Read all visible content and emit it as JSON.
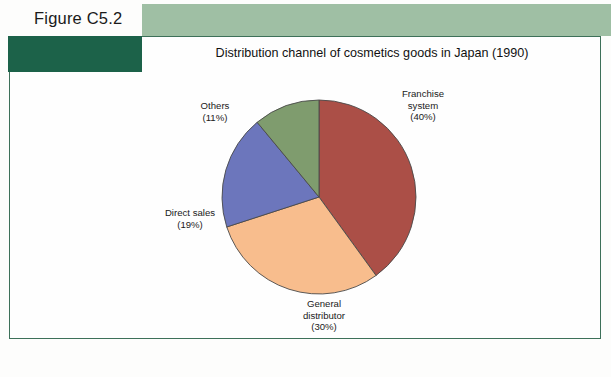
{
  "figure": {
    "number_label": "Figure C5.2",
    "title": "Distribution channel of cosmetics goods in Japan (1990)"
  },
  "theme": {
    "banner_light": "#9fbfa4",
    "banner_dark": "#1c6249",
    "frame_line": "#3d7059",
    "page_background": "#fdfdfc"
  },
  "labels": {
    "franchise": {
      "name": "Franchise",
      "name2": "system",
      "pct": "(40%)"
    },
    "general": {
      "name": "General",
      "name2": "distributor",
      "pct": "(30%)"
    },
    "direct": {
      "name": "Direct sales",
      "name2": "",
      "pct": "(19%)"
    },
    "others": {
      "name": "Others",
      "name2": "",
      "pct": "(11%)"
    }
  },
  "chart_data": {
    "type": "pie",
    "title": "Distribution channel of cosmetics goods in Japan (1990)",
    "xlabel": "",
    "ylabel": "",
    "units": "percent",
    "start_angle_deg": 0,
    "direction": "clockwise",
    "legend": "none (direct slice callouts)",
    "grid": false,
    "categories": [
      "Franchise system",
      "General distributor",
      "Direct sales",
      "Others"
    ],
    "values": [
      40,
      30,
      19,
      11
    ],
    "value_labels": [
      "(40%)",
      "(30%)",
      "(19%)",
      "(11%)"
    ],
    "colors": [
      "#ab4f47",
      "#f8bd8d",
      "#6c76bc",
      "#7f9c6e"
    ],
    "slices": [
      {
        "label": "Franchise system",
        "value": 40,
        "color": "#ab4f47",
        "start_deg": 0,
        "end_deg": 144
      },
      {
        "label": "General distributor",
        "value": 30,
        "color": "#f8bd8d",
        "start_deg": 144,
        "end_deg": 252
      },
      {
        "label": "Direct sales",
        "value": 19,
        "color": "#6c76bc",
        "start_deg": 252,
        "end_deg": 320.4
      },
      {
        "label": "Others",
        "value": 11,
        "color": "#7f9c6e",
        "start_deg": 320.4,
        "end_deg": 360
      }
    ]
  }
}
